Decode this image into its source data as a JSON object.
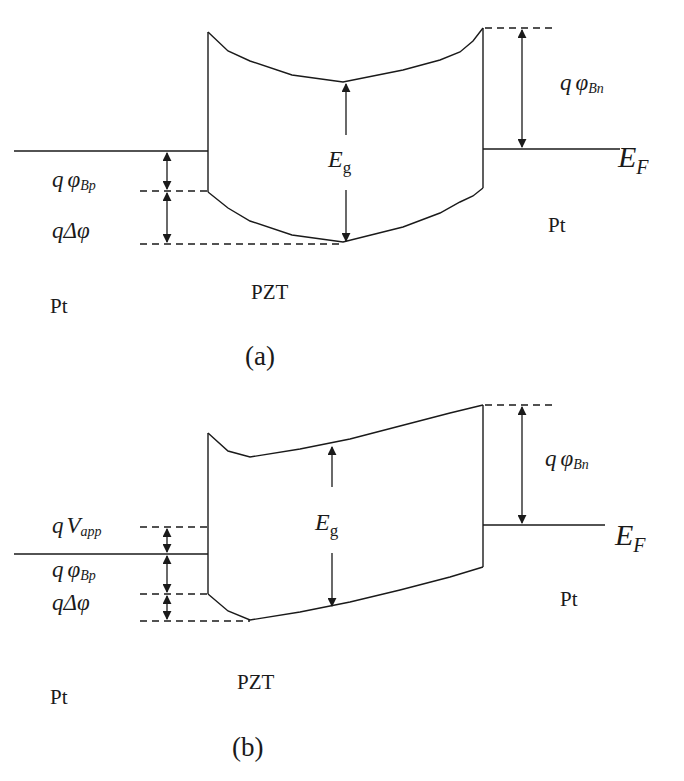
{
  "diagram_a": {
    "caption": "(a)",
    "left_metal": "Pt",
    "right_metal": "Pt",
    "insulator": "PZT",
    "labels": {
      "fermi_main": "E",
      "fermi_sub": "F",
      "gap_main": "E",
      "gap_sub": "g",
      "barrier_n_q": "q",
      "barrier_n_phi": "φ",
      "barrier_n_sub": "Bn",
      "barrier_p_q": "q",
      "barrier_p_phi": "φ",
      "barrier_p_sub": "Bp",
      "delta_phi": "qΔφ"
    }
  },
  "diagram_b": {
    "caption": "(b)",
    "left_metal": "Pt",
    "right_metal": "Pt",
    "insulator": "PZT",
    "labels": {
      "fermi_main": "E",
      "fermi_sub": "F",
      "gap_main": "E",
      "gap_sub": "g",
      "barrier_n_q": "q",
      "barrier_n_phi": "φ",
      "barrier_n_sub": "Bn",
      "vapp_q": "q",
      "vapp_main": "V",
      "vapp_sub": "app",
      "barrier_p_q": "q",
      "barrier_p_phi": "φ",
      "barrier_p_sub": "Bp",
      "delta_phi": "qΔφ"
    }
  },
  "colors": {
    "line": "#1a1a1a",
    "background": "#ffffff"
  }
}
